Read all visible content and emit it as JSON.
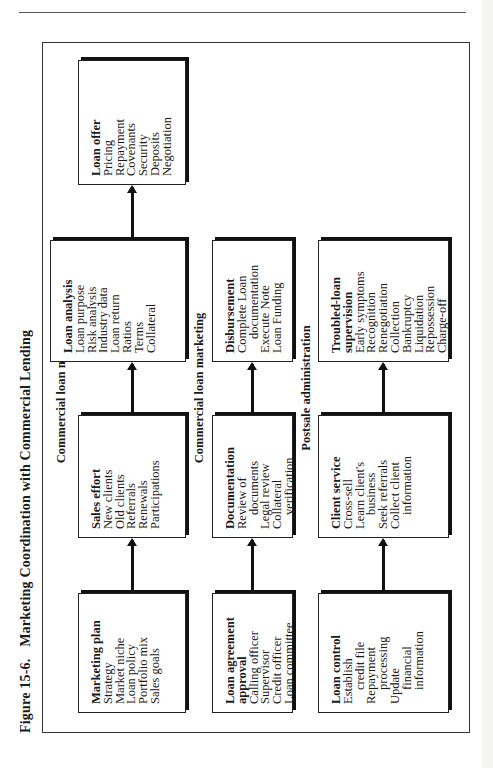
{
  "figure": {
    "number": "Figure 15-6.",
    "title": "Marketing Coordination with Commercial Lending"
  },
  "sections": [
    {
      "label": "Commercial loan marketing",
      "boxes": [
        {
          "title": "Marketing plan",
          "items": [
            "Strategy",
            "Market niche",
            "Loan policy",
            "Portfolio mix",
            "Sales goals"
          ]
        },
        {
          "title": "Sales effort",
          "items": [
            "New clients",
            "Old clients",
            "Referrals",
            "Renewals",
            "Participations"
          ]
        },
        {
          "title": "Loan analysis",
          "items": [
            "Loan purpose",
            "Risk analysis",
            "Industry data",
            "Loan return",
            "Ratios",
            "Terms",
            "Collateral"
          ]
        },
        {
          "title": "Loan offer",
          "items": [
            "Pricing",
            "Repayment",
            "Covenants",
            "Security",
            "Deposits",
            "Negotiation"
          ]
        }
      ]
    },
    {
      "label": "Commercial loan marketing",
      "boxes": [
        {
          "title": "Loan agreement",
          "title2": "approval",
          "items": [
            "Calling officer",
            "Supervisor",
            "Credit officer",
            "Loan committee"
          ]
        },
        {
          "title": "Documentation",
          "items": [
            "Review of",
            "documents",
            "Legal review",
            "Collateral",
            "verification"
          ]
        },
        {
          "title": "Disbursement",
          "items": [
            "Complete Loan",
            "documentation",
            "Execute Note",
            "Loan Funding"
          ]
        }
      ]
    },
    {
      "label": "Postsale administration",
      "boxes": [
        {
          "title": "Loan control",
          "items": [
            "Establish",
            "credit file",
            "Repayment",
            "processing",
            "Update",
            "financial",
            "information"
          ]
        },
        {
          "title": "Client service",
          "items": [
            "Cross-sell",
            "Learn client's",
            "business",
            "Seek referrals",
            "Collect client",
            "information"
          ]
        },
        {
          "title": "Troubled-loan",
          "title2": "supervision",
          "items": [
            "Early symptoms",
            "Recognition",
            "Renegotiation",
            "Collection",
            "Bankruptcy",
            "Liquidation",
            "Repossession",
            "Charge-off"
          ]
        }
      ]
    }
  ]
}
